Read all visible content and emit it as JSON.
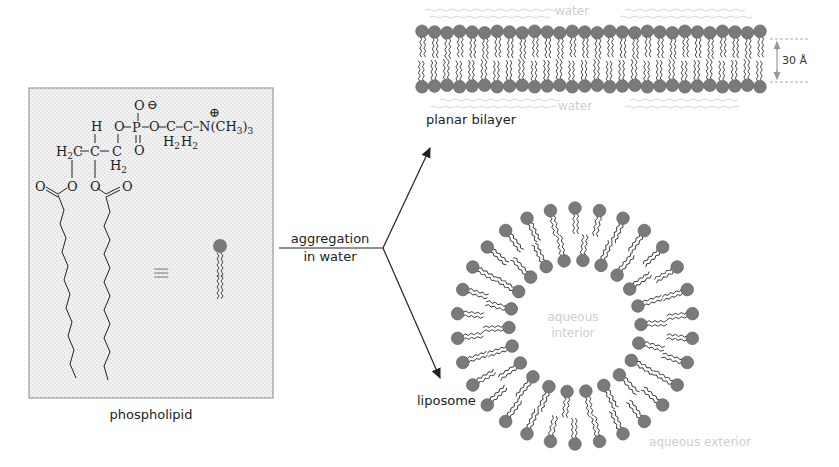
{
  "phospholipid_panel": {
    "caption": "phospholipid",
    "equivalence_symbol": "≡",
    "formula": {
      "headgroup": "O-P-O-C-C-N(CH3)3",
      "charges": [
        "⊖",
        "⊕"
      ],
      "labels": {
        "H": "H",
        "H2C": "H",
        "H2C_sub": "2",
        "C": "C",
        "CH2_H": "H",
        "CH2_sub": "2",
        "O": "O",
        "P": "P",
        "N": "N(CH",
        "N_sub": "3",
        "N_close": ")",
        "N_sub2": "3",
        "minus": "⊖",
        "plus": "⊕",
        "dash": "–",
        "eq": "="
      }
    },
    "colors": {
      "panel_bg": "#f1f1f1",
      "panel_border": "#9a9a9a",
      "head": "#7a7a7a"
    }
  },
  "reaction": {
    "label_line1": "aggregation",
    "label_line2": "in water"
  },
  "planar_bilayer": {
    "caption": "planar bilayer",
    "top_medium": "water",
    "bottom_medium": "water",
    "thickness_label": "30 Å",
    "lipid_count_per_leaflet": 28
  },
  "liposome": {
    "caption": "liposome",
    "interior_label_line1": "aqueous",
    "interior_label_line2": "interior",
    "exterior_label": "aqueous exterior",
    "outer_lipid_count": 30,
    "inner_lipid_count": 22
  }
}
